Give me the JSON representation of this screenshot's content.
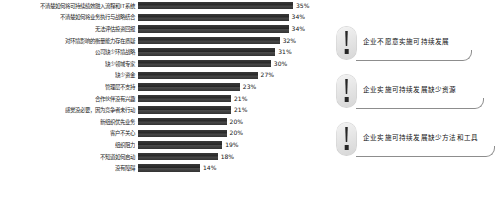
{
  "chart_data": {
    "type": "bar",
    "orientation": "horizontal",
    "title": "",
    "xlabel": "",
    "ylabel": "",
    "xlim": [
      0,
      35
    ],
    "grid": false,
    "legend": "none",
    "value_suffix": "%",
    "categories": [
      "不清楚如何将可持续绩效融入流程和IT系统",
      "不清楚如何将业务执行与战略结合",
      "无法评估投资回报",
      "对环境影响的衡量能力存在质疑",
      "公司缺少环境战略",
      "缺少领域专家",
      "缺少资金",
      "管理层不支持",
      "合作伙伴没有兴趣",
      "感觉没必要，因为竞争者未行动",
      "新组织优先业务",
      "客户不关心",
      "组织阻力",
      "不知道如何启动",
      "没有障碍"
    ],
    "values": [
      35,
      34,
      34,
      32,
      31,
      30,
      27,
      23,
      21,
      21,
      20,
      20,
      19,
      18,
      14
    ],
    "value_labels": [
      "35%",
      "34%",
      "34%",
      "32%",
      "31%",
      "30%",
      "27%",
      "23%",
      "21%",
      "21%",
      "20%",
      "20%",
      "19%",
      "18%",
      "14%"
    ]
  },
  "callouts": [
    {
      "icon": "exclamation-icon",
      "label": "企业不愿意实施可持续发展",
      "line": "short"
    },
    {
      "icon": "exclamation-icon",
      "label": "企业实施可持续发展缺少资源",
      "line": "mid"
    },
    {
      "icon": "exclamation-icon",
      "label": "企业实施可持续发展缺少方法和工具",
      "line": "long"
    }
  ],
  "colors": {
    "bar": "#2f2f2f",
    "text": "#111111",
    "bubble": "#e9e9e9",
    "connector": "#8d8d8d"
  }
}
